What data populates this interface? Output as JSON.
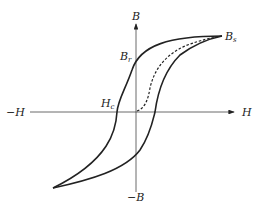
{
  "diagram": {
    "type": "hysteresis-loop",
    "labels": {
      "b_axis": "B",
      "neg_b_axis": "−B",
      "h_axis": "H",
      "neg_h_axis": "−H",
      "remanence": "B",
      "remanence_sub": "r",
      "saturation": "B",
      "saturation_sub": "s",
      "coercivity": "H",
      "coercivity_sub": "c"
    },
    "colors": {
      "line": "#222222",
      "background": "#ffffff"
    }
  }
}
